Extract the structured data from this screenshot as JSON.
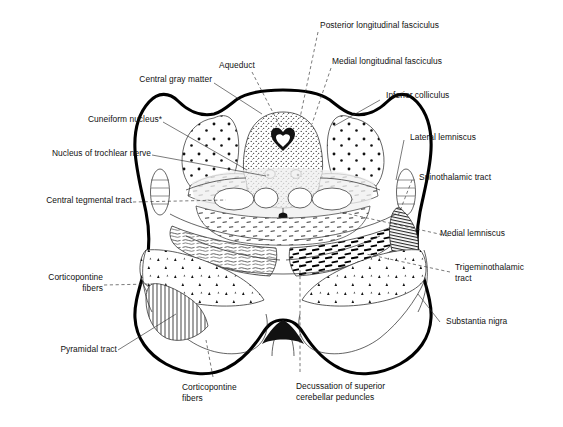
{
  "figure": {
    "type": "anatomical-cross-section",
    "background_color": "#ffffff",
    "line_color": "#000000",
    "text_color": "#111111"
  },
  "labels": {
    "central_gray_matter": "Central gray matter",
    "cuneiform_nucleus": "Cuneiform nucleus*",
    "nucleus_of_trochlear_nerve": "Nucleus of trochlear nerve",
    "central_tegmental_tract": "Central tegmental tract",
    "corticopontine_fibers_left_line1": "Corticopontine",
    "corticopontine_fibers_left_line2": "fibers",
    "pyramidal_tract": "Pyramidal tract",
    "corticopontine_fibers_bottom_line1": "Corticopontine",
    "corticopontine_fibers_bottom_line2": "fibers",
    "aqueduct": "Aqueduct",
    "posterior_longitudinal_fasciculus": "Posterior longitudinal fasciculus",
    "medial_longitudinal_fasciculus": "Medial longitudinal fasciculus",
    "inferior_colliculus": "Inferior colliculus",
    "lateral_lemniscus": "Lateral lemniscus",
    "spinothalamic_tract": "Spinothalamic tract",
    "medial_lemniscus": "Medial lemniscus",
    "trigeminothalamic_tract_line1": "Trigeminothalamic",
    "trigeminothalamic_tract_line2": "tract",
    "substantia_nigra": "Substantia nigra",
    "decussation_line1": "Decussation of superior",
    "decussation_line2": "cerebellar peduncles"
  }
}
